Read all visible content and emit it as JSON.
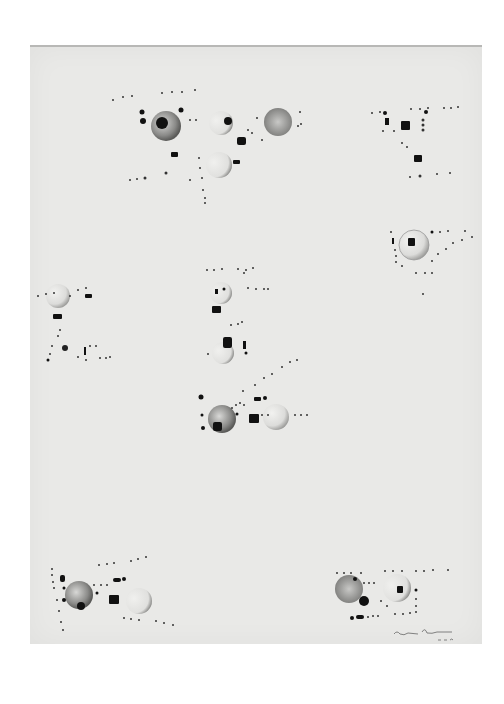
{
  "artwork": {
    "description": "Abstract drawing of shaded spheres, black squares and dotted lines on gray paper",
    "paper_color": "#e9e9e7",
    "ink_color": "#111111",
    "signature": "illegible signature, lower right"
  },
  "groups": [
    {
      "name": "top-left-cluster",
      "x": 210,
      "y": 130
    },
    {
      "name": "top-right-cluster",
      "x": 410,
      "y": 130
    },
    {
      "name": "right-middle-cluster",
      "x": 415,
      "y": 245
    },
    {
      "name": "left-middle-cluster",
      "x": 60,
      "y": 320
    },
    {
      "name": "center-cluster",
      "x": 230,
      "y": 340
    },
    {
      "name": "center-lower-cluster",
      "x": 245,
      "y": 415
    },
    {
      "name": "bottom-left-cluster",
      "x": 110,
      "y": 600
    },
    {
      "name": "bottom-right-cluster",
      "x": 380,
      "y": 595
    }
  ]
}
